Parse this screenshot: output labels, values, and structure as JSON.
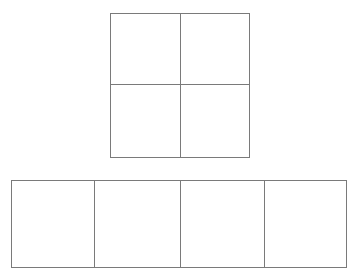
{
  "diagram": {
    "stroke_color": "#7a7a7a",
    "background": "#ffffff",
    "top_grid": {
      "description": "2x2 grid of squares",
      "rows": 2,
      "cols": 2,
      "x": 110,
      "y": 13,
      "width": 139,
      "height": 144
    },
    "bottom_strip": {
      "description": "1x4 row of squares",
      "rows": 1,
      "cols": 4,
      "x": 11,
      "y": 180,
      "width": 335,
      "height": 87,
      "dividers_x": [
        94,
        180,
        264
      ]
    }
  }
}
